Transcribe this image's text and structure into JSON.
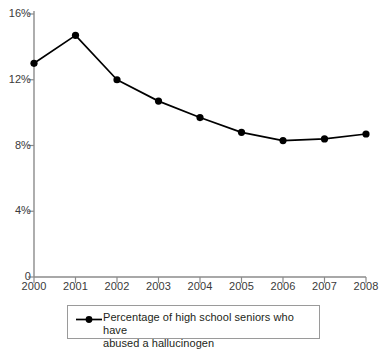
{
  "chart_data": {
    "type": "line",
    "title": "",
    "subtitle": "",
    "xlabel": "",
    "ylabel": "",
    "categories": [
      "2000",
      "2001",
      "2002",
      "2003",
      "2004",
      "2005",
      "2006",
      "2007",
      "2008"
    ],
    "x": [
      2000,
      2001,
      2002,
      2003,
      2004,
      2005,
      2006,
      2007,
      2008
    ],
    "series": [
      {
        "name": "Percentage of high school seniors who have abused a hallucinogen",
        "values": [
          13.0,
          14.7,
          12.0,
          10.7,
          9.7,
          8.8,
          8.3,
          8.4,
          8.7
        ],
        "color": "#000000",
        "marker": "circle",
        "line_width": 1.6
      }
    ],
    "ylim": [
      0,
      16
    ],
    "xlim": [
      2000,
      2008
    ],
    "yticks": [
      0,
      4,
      8,
      12,
      16
    ],
    "ytick_labels": [
      "0",
      "4%",
      "8%",
      "12%",
      "16%"
    ],
    "xticks": [
      2000,
      2001,
      2002,
      2003,
      2004,
      2005,
      2006,
      2007,
      2008
    ],
    "xtick_labels": [
      "2000",
      "2001",
      "2002",
      "2003",
      "2004",
      "2005",
      "2006",
      "2007",
      "2008"
    ],
    "grid": false,
    "legend_position": "bottom",
    "axis_color": "#8b8b8b",
    "text_color": "#3a3a3a"
  },
  "legend": {
    "entries": [
      {
        "label_line1": "Percentage of high school seniors who have",
        "label_line2": "abused a hallucinogen",
        "marker": "line-circle-marker"
      }
    ]
  }
}
